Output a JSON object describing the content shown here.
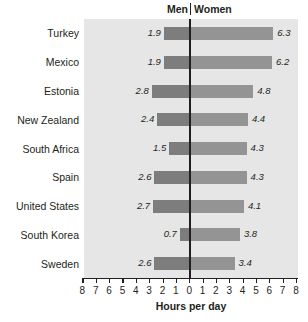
{
  "chart_data": {
    "type": "bar",
    "subtype": "diverging-butterfly",
    "title": "",
    "xlabel": "Hours per day",
    "ylabel": "",
    "categories": [
      "Turkey",
      "Mexico",
      "Estonia",
      "New Zealand",
      "South Africa",
      "Spain",
      "United States",
      "South Korea",
      "Sweden"
    ],
    "series": [
      {
        "name": "Men",
        "side": "left",
        "values": [
          1.9,
          1.9,
          2.8,
          2.4,
          1.5,
          2.6,
          2.7,
          0.7,
          2.6
        ]
      },
      {
        "name": "Women",
        "side": "right",
        "values": [
          6.3,
          6.2,
          4.8,
          4.4,
          4.3,
          4.3,
          4.1,
          3.8,
          3.4
        ]
      }
    ],
    "xlim": [
      -8,
      8
    ],
    "xticks": [
      8,
      7,
      6,
      5,
      4,
      3,
      2,
      1,
      0,
      1,
      2,
      3,
      4,
      5,
      6,
      7,
      8
    ],
    "xtick_labels": [
      "8",
      "7",
      "6",
      "5",
      "4",
      "3",
      "2",
      "1",
      "0",
      "1",
      "2",
      "3",
      "4",
      "5",
      "6",
      "7",
      "8"
    ],
    "grid": false,
    "legend_position": "top",
    "value_labels_shown": true,
    "value_label_format": "one-decimal-italic"
  },
  "header": {
    "left_label": "Men",
    "right_label": "Women"
  },
  "colors": {
    "bar_left": "#7d7d7d",
    "bar_right": "#949494",
    "plot_background": "#e6e6e6",
    "page_background": "#ffffff",
    "axis": "#231f20",
    "text": "#231f20"
  }
}
